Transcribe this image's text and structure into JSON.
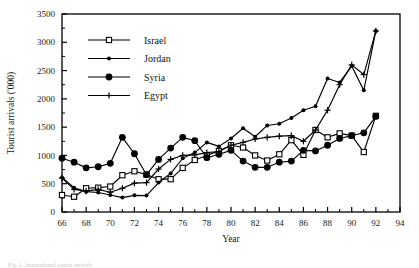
{
  "figure": {
    "caption_fragment": "Fig. 1. International tourist arrivals"
  },
  "chart_data": {
    "type": "line",
    "title": "",
    "xlabel": "Year",
    "ylabel": "Tourist arrivals ('000)",
    "xlim": [
      66,
      94
    ],
    "ylim": [
      0,
      3500
    ],
    "ytick_step": 500,
    "xtick_step": 2,
    "minor_ticks": true,
    "grid": false,
    "legend_position": "top-left inside axes",
    "xticks": [
      66,
      68,
      70,
      72,
      74,
      76,
      78,
      80,
      82,
      84,
      86,
      88,
      90,
      92,
      94
    ],
    "xtick_labels": [
      "66",
      "68",
      "70",
      "72",
      "74",
      "76",
      "78",
      "80",
      "82",
      "84",
      "86",
      "88",
      "90",
      "92",
      "94"
    ],
    "yticks": [
      0,
      500,
      1000,
      1500,
      2000,
      2500,
      3000,
      3500
    ],
    "ytick_labels": [
      "0",
      "500",
      "1000",
      "1500",
      "2000",
      "2500",
      "3000",
      "3500"
    ],
    "x": [
      66,
      67,
      68,
      69,
      70,
      71,
      72,
      73,
      74,
      75,
      76,
      77,
      78,
      79,
      80,
      81,
      82,
      83,
      84,
      85,
      86,
      87,
      88,
      89,
      90,
      91,
      92
    ],
    "series": [
      {
        "name": "Israel",
        "marker": "open-square",
        "values": [
          300,
          270,
          420,
          430,
          450,
          650,
          720,
          660,
          580,
          580,
          780,
          920,
          1000,
          1080,
          1180,
          1140,
          1000,
          910,
          1020,
          1270,
          1010,
          1450,
          1320,
          1390,
          1350,
          1060,
          1700
        ]
      },
      {
        "name": "Jordan",
        "marker": "small-filled-circle",
        "values": [
          610,
          430,
          360,
          345,
          300,
          255,
          295,
          290,
          520,
          680,
          950,
          1050,
          1230,
          1160,
          1300,
          1480,
          1330,
          1530,
          1560,
          1660,
          1800,
          1870,
          2360,
          2290,
          2580,
          2150,
          3200
        ]
      },
      {
        "name": "Syria",
        "marker": "large-filled-circle",
        "values": [
          950,
          880,
          780,
          800,
          860,
          1320,
          1030,
          660,
          930,
          1130,
          1320,
          1260,
          960,
          1020,
          1090,
          900,
          790,
          790,
          880,
          900,
          1090,
          1080,
          1180,
          1300,
          1350,
          1400,
          1690
        ]
      },
      {
        "name": "Egypt",
        "marker": "plus",
        "values": [
          600,
          400,
          370,
          400,
          350,
          420,
          510,
          520,
          760,
          930,
          1000,
          1010,
          1050,
          1070,
          1180,
          1230,
          1290,
          1320,
          1340,
          1350,
          1250,
          1450,
          1800,
          2250,
          2600,
          2430,
          3200
        ]
      }
    ],
    "legend_entries": [
      "Israel",
      "Jordan",
      "Syria",
      "Egypt"
    ]
  }
}
